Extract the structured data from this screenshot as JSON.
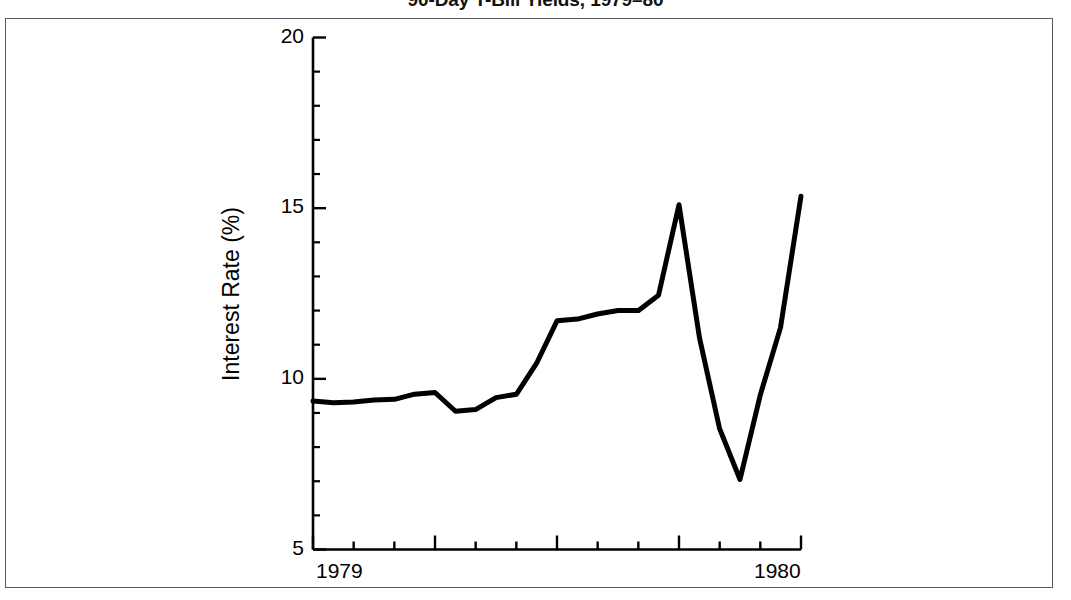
{
  "chart_data": {
    "type": "line",
    "title": "90-Day T-Bill Yields, 1979–80",
    "subtitle": "",
    "xlabel": "",
    "ylabel": "Interest Rate (%)",
    "xlim": [
      1979.0,
      1980.0
    ],
    "ylim": [
      5,
      20
    ],
    "grid": false,
    "legend_position": "none",
    "x_tick_labels": [
      "1979",
      "1980"
    ],
    "x_tick_values": [
      1979.0,
      1980.0
    ],
    "y_tick_labels": [
      "5",
      "10",
      "15",
      "20"
    ],
    "y_tick_values": [
      5,
      10,
      15,
      20
    ],
    "y_minor_tick_values": [
      6,
      7,
      8,
      9,
      11,
      12,
      13,
      14,
      16,
      17,
      18,
      19
    ],
    "x_minor_tick_count": 11,
    "series": [
      {
        "name": "90-Day T-Bill Yield",
        "color": "#000000",
        "line_width": 5,
        "x": [
          1979.0,
          1979.042,
          1979.083,
          1979.125,
          1979.167,
          1979.208,
          1979.25,
          1979.292,
          1979.333,
          1979.375,
          1979.417,
          1979.458,
          1979.5,
          1979.542,
          1979.583,
          1979.625,
          1979.667,
          1979.708,
          1979.75,
          1979.792,
          1979.833,
          1979.875,
          1979.917,
          1979.958,
          1980.0
        ],
        "values": [
          9.35,
          9.3,
          9.32,
          9.38,
          9.4,
          9.55,
          9.6,
          9.05,
          9.1,
          9.45,
          9.55,
          10.45,
          11.7,
          11.75,
          11.9,
          12.0,
          12.0,
          12.45,
          15.1,
          11.2,
          8.55,
          7.05,
          9.55,
          11.5,
          15.35
        ]
      }
    ],
    "annotations": []
  },
  "figure": {
    "background_color": "#ffffff",
    "frame_color": "#555c63",
    "axis_color": "#000000",
    "line_color": "#000000"
  }
}
